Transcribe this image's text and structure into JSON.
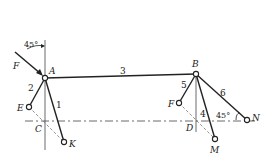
{
  "diagram": {
    "type": "mechanism linkage",
    "points": {
      "A": "A",
      "B": "B",
      "C": "C",
      "D": "D",
      "E": "E",
      "F_pin": "F",
      "K": "K",
      "M": "M",
      "N": "N"
    },
    "force_label": "F",
    "links": [
      "1",
      "2",
      "3",
      "4",
      "5",
      "6"
    ],
    "angles": {
      "force_angle": "45°",
      "link6_angle": "45°"
    },
    "colors": {
      "line": "#222222",
      "background": "#ffffff",
      "dashed": "#555555"
    }
  }
}
